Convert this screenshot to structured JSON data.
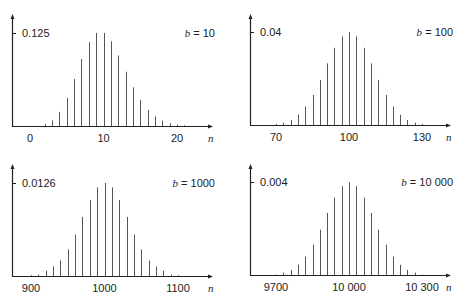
{
  "chart_data": [
    {
      "type": "bar",
      "title": "b = 10",
      "param_label": "b",
      "param_value": "10",
      "xlabel": "n",
      "ylabel": "",
      "y_tick_label": "0.125",
      "y_tick_value": 0.125,
      "x_tick_labels": [
        "0",
        "10",
        "20"
      ],
      "x_tick_values": [
        0,
        10,
        20
      ],
      "xlim": [
        -2,
        25
      ],
      "ylim": [
        0,
        0.145
      ],
      "grid": false,
      "x": [
        0,
        1,
        2,
        3,
        4,
        5,
        6,
        7,
        8,
        9,
        10,
        11,
        12,
        13,
        14,
        15,
        16,
        17,
        18,
        19,
        20,
        21,
        22
      ],
      "values": [
        5e-05,
        0.0005,
        0.0023,
        0.0076,
        0.0189,
        0.0378,
        0.0631,
        0.0901,
        0.1126,
        0.1251,
        0.1251,
        0.1137,
        0.0948,
        0.0729,
        0.0521,
        0.0347,
        0.0217,
        0.0128,
        0.0071,
        0.0037,
        0.0019,
        0.0009,
        0.0004
      ]
    },
    {
      "type": "bar",
      "title": "b = 100",
      "param_label": "b",
      "param_value": "100",
      "xlabel": "n",
      "ylabel": "",
      "y_tick_label": "0.04",
      "y_tick_value": 0.04,
      "x_tick_labels": [
        "70",
        "100",
        "130"
      ],
      "x_tick_values": [
        70,
        100,
        130
      ],
      "xlim": [
        65,
        137
      ],
      "ylim": [
        0,
        0.0465
      ],
      "grid": false,
      "x": [
        70,
        73,
        76,
        79,
        82,
        85,
        88,
        91,
        94,
        97,
        100,
        103,
        106,
        109,
        112,
        115,
        118,
        121,
        124,
        127,
        130
      ],
      "values": [
        0.0004,
        0.001,
        0.0021,
        0.0044,
        0.0079,
        0.0129,
        0.0194,
        0.0265,
        0.0332,
        0.0381,
        0.0399,
        0.0381,
        0.0332,
        0.0265,
        0.0194,
        0.0129,
        0.0079,
        0.0044,
        0.0021,
        0.001,
        0.0004
      ]
    },
    {
      "type": "bar",
      "title": "b = 1000",
      "param_label": "b",
      "param_value": "1000",
      "xlabel": "n",
      "ylabel": "",
      "y_tick_label": "0.0126",
      "y_tick_value": 0.0126,
      "x_tick_labels": [
        "900",
        "1000",
        "1100"
      ],
      "x_tick_values": [
        900,
        1000,
        1100
      ],
      "xlim": [
        880,
        1125
      ],
      "ylim": [
        0,
        0.0146
      ],
      "grid": false,
      "x": [
        900,
        910,
        920,
        930,
        940,
        950,
        960,
        970,
        980,
        990,
        1000,
        1010,
        1020,
        1030,
        1040,
        1050,
        1060,
        1070,
        1080,
        1090,
        1100
      ],
      "values": [
        0.0001,
        0.0002,
        0.0007,
        0.0013,
        0.0021,
        0.0036,
        0.0056,
        0.008,
        0.0103,
        0.012,
        0.0126,
        0.012,
        0.0103,
        0.008,
        0.0056,
        0.0036,
        0.0021,
        0.0013,
        0.0007,
        0.0002,
        0.0001
      ]
    },
    {
      "type": "bar",
      "title": "b = 10 000",
      "param_label": "b",
      "param_value": "10 000",
      "xlabel": "n",
      "ylabel": "",
      "y_tick_label": "0.004",
      "y_tick_value": 0.004,
      "x_tick_labels": [
        "9700",
        "10 000",
        "10 300"
      ],
      "x_tick_values": [
        9700,
        10000,
        10300
      ],
      "xlim": [
        9640,
        10370
      ],
      "ylim": [
        0,
        0.00466
      ],
      "grid": false,
      "x": [
        9700,
        9730,
        9760,
        9790,
        9820,
        9850,
        9880,
        9910,
        9940,
        9970,
        10000,
        10030,
        10060,
        10090,
        10120,
        10150,
        10180,
        10210,
        10240,
        10270,
        10300
      ],
      "values": [
        2e-05,
        0.0001,
        0.00022,
        0.00044,
        0.00079,
        0.0013,
        0.00195,
        0.00267,
        0.00333,
        0.00382,
        0.00399,
        0.00382,
        0.00333,
        0.00267,
        0.00195,
        0.0013,
        0.00079,
        0.00044,
        0.00022,
        0.0001,
        2e-05
      ]
    }
  ]
}
